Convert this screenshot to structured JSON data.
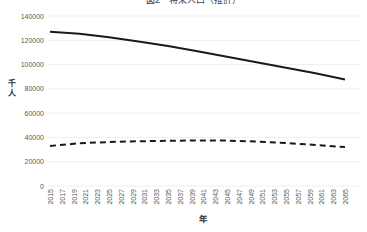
{
  "chart_data": {
    "type": "line",
    "title": "図2　将来人口（推計）",
    "xlabel": "年",
    "ylabel": "千人",
    "ylim": [
      0,
      140000
    ],
    "ytick_step": 20000,
    "grid": "horizontal",
    "legend": "none",
    "x_tick_labels": [
      "2015",
      "2017",
      "2019",
      "2021",
      "2023",
      "2025",
      "2027",
      "2029",
      "2031",
      "2033",
      "2035",
      "2037",
      "2039",
      "2041",
      "2043",
      "2045",
      "2047",
      "2049",
      "2051",
      "2053",
      "2055",
      "2057",
      "2059",
      "2061",
      "2063",
      "2065"
    ],
    "x": [
      2015,
      2020,
      2025,
      2030,
      2035,
      2040,
      2045,
      2050,
      2055,
      2060,
      2065
    ],
    "series": [
      {
        "name": "Series 1 (solid line, total population)",
        "style": "solid",
        "values": [
          127100,
          125300,
          122500,
          119100,
          115200,
          110900,
          106400,
          101900,
          97400,
          92800,
          87800
        ]
      },
      {
        "name": "Series 2 (dashed line)",
        "style": "dashed",
        "values": [
          33000,
          35200,
          36200,
          36800,
          37200,
          37500,
          37400,
          36600,
          35400,
          33800,
          32000
        ]
      }
    ]
  },
  "colors": {
    "line": "#1a1a1a",
    "grid": "#efefef",
    "tick": "#595959",
    "title": "#404040"
  }
}
